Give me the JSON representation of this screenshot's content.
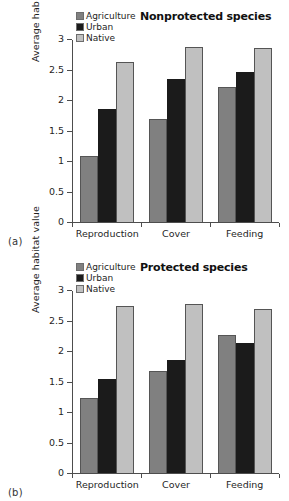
{
  "chart_data": [
    {
      "type": "bar",
      "panel": "(a)",
      "title": "Nonprotected species",
      "xlabel": "",
      "ylabel": "Average habitat value",
      "categories": [
        "Reproduction",
        "Cover",
        "Feeding"
      ],
      "series": [
        {
          "name": "Agriculture",
          "color": "#808080",
          "values": [
            1.09,
            1.69,
            2.21
          ]
        },
        {
          "name": "Urban",
          "color": "#1b1b1b",
          "values": [
            1.86,
            2.35,
            2.46
          ]
        },
        {
          "name": "Native",
          "color": "#c0c0c0",
          "values": [
            2.63,
            2.87,
            2.85
          ]
        }
      ],
      "ylim": [
        0,
        3
      ],
      "yticks": [
        "0",
        "0.5",
        "1",
        "1.5",
        "2",
        "2.5",
        "3"
      ],
      "ytick_values": [
        0,
        0.5,
        1,
        1.5,
        2,
        2.5,
        3
      ],
      "grid": false,
      "legend_position": "top-left"
    },
    {
      "type": "bar",
      "panel": "(b)",
      "title": "Protected species",
      "xlabel": "",
      "ylabel": "Average habitat value",
      "categories": [
        "Reproduction",
        "Cover",
        "Feeding"
      ],
      "series": [
        {
          "name": "Agriculture",
          "color": "#808080",
          "values": [
            1.23,
            1.67,
            2.27
          ]
        },
        {
          "name": "Urban",
          "color": "#1b1b1b",
          "values": [
            1.54,
            1.86,
            2.13
          ]
        },
        {
          "name": "Native",
          "color": "#c0c0c0",
          "values": [
            2.73,
            2.77,
            2.69
          ]
        }
      ],
      "ylim": [
        0,
        3
      ],
      "yticks": [
        "0",
        "0.5",
        "1",
        "1.5",
        "2",
        "2.5",
        "3"
      ],
      "ytick_values": [
        0,
        0.5,
        1,
        1.5,
        2,
        2.5,
        3
      ],
      "grid": false,
      "legend_position": "top-left"
    }
  ]
}
